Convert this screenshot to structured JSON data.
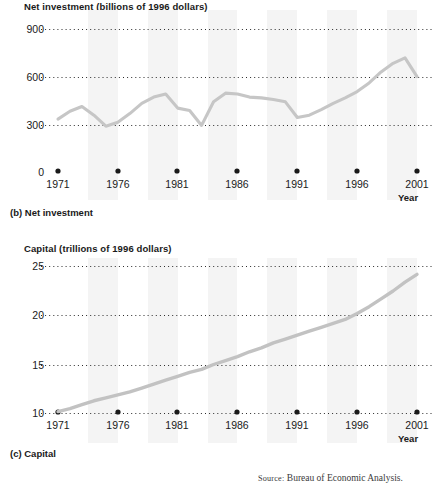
{
  "figure": {
    "source_prefix": "Source:",
    "source_text": " Bureau of Economic Analysis."
  },
  "panel_b": {
    "caption": "(b) Net investment",
    "axis_title": "Net investment (billions of 1996 dollars)",
    "x_axis_name": "Year"
  },
  "panel_c": {
    "caption": "(c) Capital",
    "axis_title": "Capital (trillions of 1996 dollars)",
    "x_axis_name": "Year"
  },
  "chart_data": [
    {
      "id": "net-investment",
      "type": "line",
      "title": "Net investment (billions of 1996 dollars)",
      "panel_label": "(b) Net investment",
      "xlabel": "Year",
      "ylabel": "Net investment (billions of 1996 dollars)",
      "xlim": [
        1971,
        2001
      ],
      "ylim": [
        0,
        900
      ],
      "yticks": [
        0,
        300,
        600,
        900
      ],
      "ytick_labels": [
        "0",
        "300",
        "600",
        "900"
      ],
      "xticks": [
        1971,
        1976,
        1981,
        1986,
        1991,
        1996,
        2001
      ],
      "xtick_labels": [
        "1971",
        "1976",
        "1981",
        "1986",
        "1991",
        "1996",
        "2001"
      ],
      "grid": "horizontal-dotted",
      "legend": "none",
      "line_color": "#c6c6c6",
      "x": [
        1971,
        1972,
        1973,
        1974,
        1975,
        1976,
        1977,
        1978,
        1979,
        1980,
        1981,
        1982,
        1983,
        1984,
        1985,
        1986,
        1987,
        1988,
        1989,
        1990,
        1991,
        1992,
        1993,
        1994,
        1995,
        1996,
        1997,
        1998,
        1999,
        2000,
        2001
      ],
      "y": [
        330,
        380,
        410,
        355,
        285,
        310,
        365,
        430,
        470,
        490,
        400,
        385,
        290,
        440,
        495,
        490,
        470,
        465,
        455,
        440,
        340,
        355,
        390,
        430,
        465,
        505,
        560,
        630,
        685,
        720,
        600
      ]
    },
    {
      "id": "capital",
      "type": "line",
      "title": "Capital (trillions of 1996 dollars)",
      "panel_label": "(c) Capital",
      "xlabel": "Year",
      "ylabel": "Capital (trillions of 1996 dollars)",
      "xlim": [
        1971,
        2001
      ],
      "ylim": [
        10,
        25
      ],
      "yticks": [
        10,
        15,
        20,
        25
      ],
      "ytick_labels": [
        "10",
        "15",
        "20",
        "25"
      ],
      "xticks": [
        1971,
        1976,
        1981,
        1986,
        1991,
        1996,
        2001
      ],
      "xtick_labels": [
        "1971",
        "1976",
        "1981",
        "1986",
        "1991",
        "1996",
        "2001"
      ],
      "grid": "horizontal-dotted",
      "legend": "none",
      "line_color": "#c2c2c2",
      "x": [
        1971,
        1972,
        1973,
        1974,
        1975,
        1976,
        1977,
        1978,
        1979,
        1980,
        1981,
        1982,
        1983,
        1984,
        1985,
        1986,
        1987,
        1988,
        1989,
        1990,
        1991,
        1992,
        1993,
        1994,
        1995,
        1996,
        1997,
        1998,
        1999,
        2000,
        2001
      ],
      "y": [
        10.2,
        10.5,
        10.9,
        11.3,
        11.6,
        11.9,
        12.2,
        12.6,
        13.0,
        13.4,
        13.8,
        14.2,
        14.5,
        15.0,
        15.4,
        15.8,
        16.3,
        16.7,
        17.2,
        17.6,
        18.0,
        18.4,
        18.8,
        19.2,
        19.6,
        20.2,
        20.9,
        21.7,
        22.5,
        23.4,
        24.2
      ]
    }
  ]
}
